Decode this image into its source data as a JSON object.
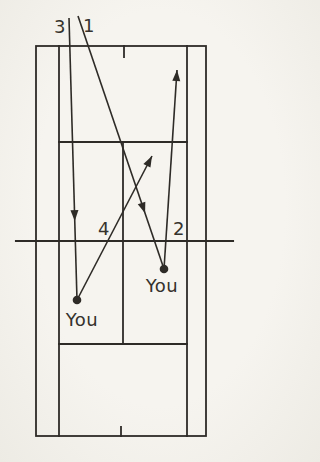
{
  "figure": {
    "background_color": "#f4f2ec",
    "ink_color": "#2e2b27",
    "canvas": {
      "width": 250,
      "height": 462
    },
    "court": {
      "outer": {
        "x1": 36,
        "y1": 46,
        "x2": 206,
        "y2": 436
      },
      "singles_sidelines_x": [
        59,
        187
      ],
      "service_lines_y": [
        142,
        344
      ],
      "center_service_line": {
        "x": 123,
        "y1": 142,
        "y2": 344
      },
      "net": {
        "y": 241,
        "x1": 16,
        "x2": 233
      },
      "center_marks": [
        {
          "x": 124,
          "y1": 46,
          "y2": 57
        },
        {
          "x": 121,
          "y1": 427,
          "y2": 436
        }
      ]
    },
    "players": [
      {
        "id": "player-left",
        "label": "You",
        "x": 77,
        "y": 300,
        "label_x": 82,
        "label_y": 326
      },
      {
        "id": "player-right",
        "label": "You",
        "x": 164,
        "y": 269,
        "label_x": 162,
        "label_y": 292
      }
    ],
    "shots": [
      {
        "label": "1",
        "label_x": 89,
        "label_y": 32,
        "x1": 78,
        "y1": 16,
        "x2": 164,
        "y2": 269,
        "arrow_t": 0.78
      },
      {
        "label": "2",
        "label_x": 179,
        "label_y": 235,
        "x1": 164,
        "y1": 269,
        "x2": 177,
        "y2": 70,
        "arrow_t": 1
      },
      {
        "label": "3",
        "label_x": 60,
        "label_y": 33,
        "x1": 69,
        "y1": 18,
        "x2": 77,
        "y2": 300,
        "arrow_t": 0.72
      },
      {
        "label": "4",
        "label_x": 104,
        "label_y": 235,
        "x1": 77,
        "y1": 300,
        "x2": 152,
        "y2": 156,
        "arrow_t": 1
      }
    ]
  }
}
